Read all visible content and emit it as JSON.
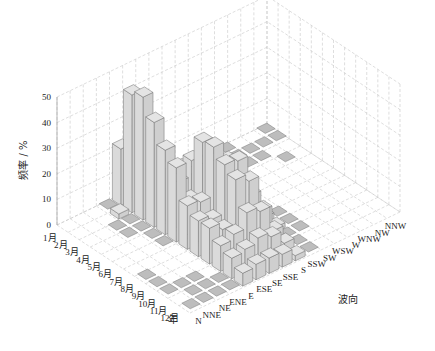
{
  "chart_data": {
    "type": "bar3d",
    "title": "",
    "xlabel": "年",
    "ylabel": "波向",
    "zlabel": "频率 / %",
    "zlim": [
      0,
      50
    ],
    "z_ticks": [
      0,
      10,
      20,
      30,
      40,
      50
    ],
    "months": [
      "1月",
      "2月",
      "3月",
      "4月",
      "5月",
      "6月",
      "7月",
      "8月",
      "9月",
      "10月",
      "11月",
      "12月"
    ],
    "directions": [
      "N",
      "NNE",
      "NE",
      "ENE",
      "E",
      "ESE",
      "SE",
      "SSE",
      "S",
      "SSW",
      "SW",
      "WSW",
      "W",
      "WNW",
      "NW",
      "NNW"
    ],
    "grid": true,
    "values": [
      [
        0,
        0,
        0,
        1,
        22,
        28,
        5,
        3,
        1,
        0,
        0,
        1,
        1,
        0,
        0,
        1
      ],
      [
        0,
        0,
        0,
        2,
        46,
        28,
        12,
        8,
        3,
        1,
        1,
        1,
        1,
        1,
        1,
        1
      ],
      [
        0,
        0,
        1,
        1,
        48,
        25,
        16,
        11,
        4,
        1,
        1,
        1,
        1,
        1,
        0,
        0
      ],
      [
        0,
        0,
        1,
        1,
        41,
        20,
        18,
        13,
        4,
        1,
        1,
        0,
        0,
        0,
        1,
        0
      ],
      [
        0,
        0,
        0,
        1,
        33,
        18,
        24,
        20,
        6,
        1,
        0,
        0,
        0,
        0,
        0,
        0
      ],
      [
        0,
        0,
        0,
        1,
        29,
        14,
        34,
        24,
        10,
        2,
        0,
        0,
        0,
        0,
        0,
        0
      ],
      [
        0,
        0,
        0,
        0,
        17,
        16,
        35,
        27,
        12,
        2,
        0,
        0,
        0,
        0,
        0,
        0
      ],
      [
        1,
        0,
        0,
        0,
        14,
        12,
        31,
        30,
        14,
        3,
        1,
        0,
        0,
        0,
        0,
        0
      ],
      [
        1,
        0,
        0,
        0,
        14,
        11,
        28,
        25,
        11,
        2,
        1,
        0,
        0,
        0,
        0,
        0
      ],
      [
        1,
        1,
        1,
        0,
        10,
        12,
        18,
        16,
        6,
        1,
        1,
        0,
        0,
        0,
        0,
        0
      ],
      [
        0,
        1,
        1,
        1,
        8,
        9,
        11,
        9,
        4,
        1,
        0,
        0,
        0,
        0,
        0,
        0
      ],
      [
        1,
        1,
        1,
        1,
        5,
        6,
        6,
        5,
        2,
        1,
        0,
        0,
        0,
        0,
        0,
        0
      ]
    ]
  },
  "labels": {
    "z_axis_title": "频率 / %",
    "month_axis_title": "年",
    "direction_axis_title": "波向"
  }
}
